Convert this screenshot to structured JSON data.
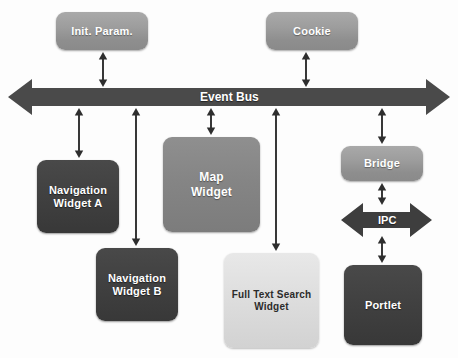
{
  "diagram": {
    "background_color": "#fdfdfd",
    "nodes": [
      {
        "id": "init-param",
        "label": "Init. Param.",
        "style": "mid",
        "x": 56,
        "y": 12,
        "w": 92,
        "h": 38,
        "font_size": 11
      },
      {
        "id": "cookie",
        "label": "Cookie",
        "style": "mid",
        "x": 266,
        "y": 12,
        "w": 92,
        "h": 38,
        "font_size": 11
      },
      {
        "id": "navigation-a",
        "label": "Navigation\nWidget  A",
        "style": "dark",
        "x": 37,
        "y": 160,
        "w": 82,
        "h": 73,
        "font_size": 11
      },
      {
        "id": "navigation-b",
        "label": "Navigation\nWidget  B",
        "style": "dark",
        "x": 96,
        "y": 248,
        "w": 82,
        "h": 73,
        "font_size": 11
      },
      {
        "id": "map-widget",
        "label": "Map\nWidget",
        "style": "mid2",
        "x": 163,
        "y": 137,
        "w": 97,
        "h": 95,
        "font_size": 12
      },
      {
        "id": "full-text-search",
        "label": "Full Text Search\nWidget",
        "style": "light",
        "x": 224,
        "y": 253,
        "w": 95,
        "h": 95,
        "font_size": 10
      },
      {
        "id": "bridge",
        "label": "Bridge",
        "style": "mid",
        "x": 341,
        "y": 146,
        "w": 82,
        "h": 35,
        "font_size": 11
      },
      {
        "id": "portlet",
        "label": "Portlet",
        "style": "dark",
        "x": 344,
        "y": 265,
        "w": 78,
        "h": 80,
        "font_size": 11
      }
    ],
    "bus": {
      "id": "event-bus",
      "label": "Event Bus",
      "label_font_size": 12,
      "y_center": 97,
      "x_start": 8,
      "x_end": 450,
      "shaft_half_height": 9,
      "head_half_height": 18,
      "head_length": 24,
      "fill": "#4a4a4a"
    },
    "ipc": {
      "id": "ipc-arrow",
      "label": "IPC",
      "label_font_size": 11,
      "y_center": 220,
      "x_start": 341,
      "x_end": 432,
      "shaft_half_height": 8,
      "head_half_height": 17,
      "head_length": 22,
      "fill": "#3e3e3e"
    },
    "connectors": [
      {
        "id": "init-param-to-bus",
        "x": 103,
        "y1": 52,
        "y2": 87,
        "double": true,
        "from": "init-param",
        "to": "event-bus"
      },
      {
        "id": "cookie-to-bus",
        "x": 306,
        "y1": 52,
        "y2": 87,
        "double": true,
        "from": "cookie",
        "to": "event-bus"
      },
      {
        "id": "bus-to-navigation-a",
        "x": 79,
        "y1": 108,
        "y2": 158,
        "double": true,
        "from": "event-bus",
        "to": "navigation-a"
      },
      {
        "id": "bus-to-navigation-b",
        "x": 136,
        "y1": 108,
        "y2": 246,
        "double": true,
        "from": "event-bus",
        "to": "navigation-b"
      },
      {
        "id": "bus-to-map-widget",
        "x": 211,
        "y1": 108,
        "y2": 135,
        "double": true,
        "from": "event-bus",
        "to": "map-widget"
      },
      {
        "id": "bus-to-full-text-search",
        "x": 276,
        "y1": 108,
        "y2": 251,
        "double": true,
        "from": "event-bus",
        "to": "full-text-search"
      },
      {
        "id": "bus-to-bridge",
        "x": 382,
        "y1": 108,
        "y2": 144,
        "double": true,
        "from": "event-bus",
        "to": "bridge"
      },
      {
        "id": "bridge-to-ipc",
        "x": 382,
        "y1": 183,
        "y2": 205,
        "double": true,
        "from": "bridge",
        "to": "ipc-arrow"
      },
      {
        "id": "ipc-to-portlet",
        "x": 382,
        "y1": 236,
        "y2": 263,
        "double": true,
        "from": "ipc-arrow",
        "to": "portlet"
      }
    ],
    "colors": {
      "arrow": "#2e2e2e",
      "bus_fill": "#4a4a4a",
      "ipc_fill": "#3e3e3e",
      "node_light": "#dedede",
      "node_mid": "#9a9a9a",
      "node_dark": "#414141",
      "text_light": "#ffffff",
      "text_dark": "#2b2b2b"
    }
  }
}
